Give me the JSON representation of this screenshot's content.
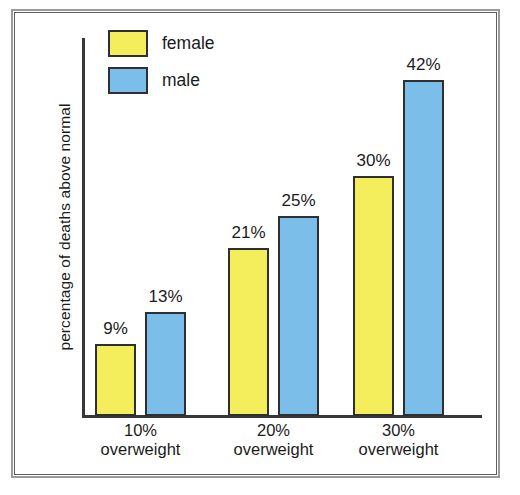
{
  "chart_data": {
    "type": "bar",
    "title": "",
    "xlabel": "",
    "ylabel": "percentage of deaths above normal",
    "categories": [
      "10%\noverweight",
      "20%\noverweight",
      "30%\noverweight"
    ],
    "category_lines": [
      [
        "10%",
        "overweight"
      ],
      [
        "20%",
        "overweight"
      ],
      [
        "30%",
        "overweight"
      ]
    ],
    "series": [
      {
        "name": "female",
        "color": "#F5EE5C",
        "values": [
          9,
          21,
          30
        ],
        "value_labels": [
          "9%",
          "21%",
          "30%"
        ]
      },
      {
        "name": "male",
        "color": "#7CBEEA",
        "values": [
          13,
          25,
          42
        ],
        "value_labels": [
          "13%",
          "25%",
          "42%"
        ]
      }
    ],
    "ylim": [
      0,
      47
    ],
    "grid": false,
    "axis_ticks_visible": false,
    "legend_position": "top-left",
    "value_labels_shown": true,
    "colors": {
      "female_fill": "#F5EE5C",
      "male_fill": "#7CBEEA",
      "bar_outline": "#2F2F33",
      "axis": "#35353A",
      "text": "#1B1B1B",
      "frame_outer": "#9A9A99",
      "frame_inner": "#5C5C5C",
      "background": "#FFFFFF"
    }
  },
  "legend": {
    "items": [
      {
        "label": "female",
        "color": "#F5EE5C"
      },
      {
        "label": "male",
        "color": "#7CBEEA"
      }
    ]
  },
  "axes": {
    "y_title": "percentage of deaths above normal"
  }
}
